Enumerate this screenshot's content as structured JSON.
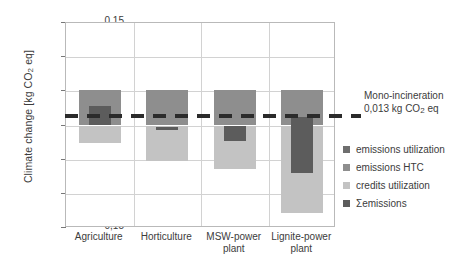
{
  "chart_data": {
    "type": "bar",
    "title": "",
    "xlabel": "",
    "ylabel": "Climate change  [kg CO2 eq]",
    "ylabel_prefix": "Climate change  [kg CO",
    "ylabel_sub": "2",
    "ylabel_suffix": " eq]",
    "ylim": [
      -0.15,
      0.15
    ],
    "ytick_values": [
      0.15,
      0.1,
      0.05,
      0.0,
      -0.05,
      -0.1,
      -0.15
    ],
    "ytick_labels": [
      "0,15",
      "0,10",
      "0,05",
      "0,00",
      "-0,05",
      "-0,10",
      "-0,15"
    ],
    "grid": true,
    "legend_position": "right",
    "categories": [
      "Agriculture",
      "Horticulture",
      "MSW-power plant",
      "Lignite-power plant"
    ],
    "category_lines": [
      [
        "Agriculture"
      ],
      [
        "Horticulture"
      ],
      [
        "MSW-power",
        "plant"
      ],
      [
        "Lignite-power",
        "plant"
      ]
    ],
    "series": [
      {
        "name": "emissions utilization",
        "color": "#8e8e8e",
        "segments": [
          {
            "category": "Agriculture",
            "from": 0.0,
            "to": 0.052
          },
          {
            "category": "Horticulture",
            "from": 0.0,
            "to": 0.052
          },
          {
            "category": "MSW-power plant",
            "from": 0.0,
            "to": 0.052
          },
          {
            "category": "Lignite-power plant",
            "from": 0.0,
            "to": 0.052
          }
        ]
      },
      {
        "name": "emissions HTC",
        "color": "#a6a6a6",
        "segments": [
          {
            "category": "Agriculture",
            "from": 0.0,
            "to": 0.0
          },
          {
            "category": "Horticulture",
            "from": 0.0,
            "to": 0.0
          },
          {
            "category": "MSW-power plant",
            "from": 0.0,
            "to": 0.0
          },
          {
            "category": "Lignite-power plant",
            "from": 0.0,
            "to": 0.0
          }
        ]
      },
      {
        "name": "credits utilization",
        "color": "#c3c3c3",
        "segments": [
          {
            "category": "Agriculture",
            "from": -0.025,
            "to": 0.0
          },
          {
            "category": "Horticulture",
            "from": -0.052,
            "to": 0.0
          },
          {
            "category": "MSW-power plant",
            "from": -0.063,
            "to": 0.0
          },
          {
            "category": "Lignite-power plant",
            "from": -0.128,
            "to": 0.0
          }
        ]
      },
      {
        "name": "Σemissions",
        "color": "#5c5c5c",
        "segments": [
          {
            "category": "Agriculture",
            "from": 0.0,
            "to": 0.028
          },
          {
            "category": "Horticulture",
            "from": -0.007,
            "to": -0.002
          },
          {
            "category": "MSW-power plant",
            "from": -0.022,
            "to": 0.0
          },
          {
            "category": "Lignite-power plant",
            "from": -0.07,
            "to": 0.012
          }
        ]
      }
    ],
    "reference_line": {
      "value": 0.013,
      "style": "dashed",
      "color": "#2b2b2b",
      "label_line1": "Mono-incineration",
      "label_line2_prefix": "0,013 kg CO",
      "label_line2_sub": "2",
      "label_line2_suffix": " eq"
    },
    "legend_entries": [
      {
        "label": "emissions utilization",
        "color": "#6e6e6e"
      },
      {
        "label": "emissions HTC",
        "color": "#8e8e8e"
      },
      {
        "label": "credits utilization",
        "color": "#c3c3c3"
      },
      {
        "label": "Σemissions",
        "color": "#5c5c5c"
      }
    ]
  }
}
